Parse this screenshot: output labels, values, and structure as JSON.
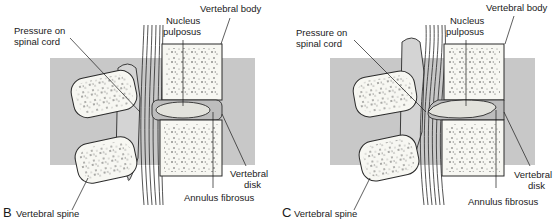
{
  "figure": {
    "panels": [
      {
        "id": "B",
        "letter": "B",
        "state": "normal disk, slight pressure",
        "labels": {
          "vertebral_body": "Vertebral body",
          "nucleus_pulposus_1": "Nucleus",
          "nucleus_pulposus_2": "pulposus",
          "pressure_1": "Pressure on",
          "pressure_2": "spinal cord",
          "vertebral_disk_1": "Vertebral",
          "vertebral_disk_2": "disk",
          "annulus_fibrosus": "Annulus fibrosus",
          "vertebral_spine": "Vertebral spine"
        }
      },
      {
        "id": "C",
        "letter": "C",
        "state": "herniated disk compressing spinal cord",
        "labels": {
          "vertebral_body": "Vertebral body",
          "nucleus_pulposus_1": "Nucleus",
          "nucleus_pulposus_2": "pulposus",
          "pressure_1": "Pressure on",
          "pressure_2": "spinal cord",
          "vertebral_disk_1": "Vertebral",
          "vertebral_disk_2": "disk",
          "annulus_fibrosus": "Annulus fibrosus",
          "vertebral_spine": "Vertebral spine"
        }
      }
    ],
    "colors": {
      "background_band": "#c8c8c8",
      "bone_fill": "#f7f7f2",
      "outline": "#2a2a2a",
      "disk_fill": "#bdbdbd",
      "nucleus_fill": "#e2e2dc",
      "nerve_fill": "#ffffff"
    }
  }
}
